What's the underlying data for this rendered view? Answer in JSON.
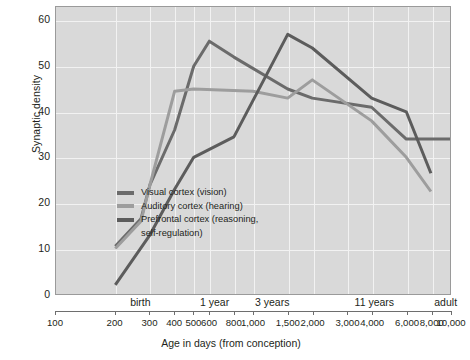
{
  "chart_data": {
    "type": "line",
    "title": "",
    "xlabel": "Age in days (from conception)",
    "ylabel": "Synaptic density",
    "xscale": "log",
    "xlim": [
      100,
      10000
    ],
    "ylim": [
      0,
      63
    ],
    "grid": true,
    "legend_position": "inside-center-left",
    "yticks": [
      0,
      10,
      20,
      30,
      40,
      50,
      60
    ],
    "xticks": [
      100,
      200,
      300,
      400,
      500,
      600,
      800,
      1000,
      1500,
      2000,
      3000,
      4000,
      6000,
      8000,
      10000
    ],
    "xtick_labels": [
      "100",
      "200",
      "300",
      "400",
      "500",
      "600",
      "800",
      "1,000",
      "1,500",
      "2,000",
      "3,000",
      "4,000",
      "6,000",
      "8,000",
      "10,000"
    ],
    "stage_annotations": [
      {
        "label": "birth",
        "x": 270
      },
      {
        "label": "1 year",
        "x": 640
      },
      {
        "label": "3 years",
        "x": 1250
      },
      {
        "label": "11 years",
        "x": 4100
      },
      {
        "label": "adult",
        "x": 9400
      }
    ],
    "series": [
      {
        "name": "Visual cortex (vision)",
        "color": "#6b6b6b",
        "x": [
          200,
          270,
          300,
          400,
          500,
          600,
          800,
          1500,
          2000,
          4000,
          6000,
          10000
        ],
        "y": [
          10.5,
          16.5,
          24,
          36,
          50,
          55.5,
          52,
          45,
          43,
          41,
          34,
          34
        ]
      },
      {
        "name": "Auditory cortex (hearing)",
        "color": "#9d9d9d",
        "x": [
          200,
          270,
          300,
          400,
          500,
          1000,
          1500,
          2000,
          4000,
          6000,
          8000
        ],
        "y": [
          10,
          16,
          24,
          44.5,
          45,
          44.5,
          43,
          47,
          38,
          30,
          22.5
        ]
      },
      {
        "name": "Prefrontal cortex (reasoning,\nself-regulation)",
        "color": "#5c5c5c",
        "x": [
          200,
          300,
          400,
          500,
          800,
          1500,
          2000,
          4000,
          6000,
          8000
        ],
        "y": [
          2,
          13,
          23,
          30,
          34.5,
          57,
          54,
          43,
          40,
          26.5
        ]
      }
    ]
  },
  "legend": {
    "items": [
      {
        "label": "Visual cortex (vision)",
        "color": "#6b6b6b"
      },
      {
        "label": "Auditory cortex (hearing)",
        "color": "#9d9d9d"
      },
      {
        "label": "Prefrontal cortex (reasoning,\nself-regulation)",
        "color": "#5c5c5c"
      }
    ]
  },
  "axes": {
    "y_title": "Synaptic density",
    "x_title": "Age in days (from conception)"
  }
}
